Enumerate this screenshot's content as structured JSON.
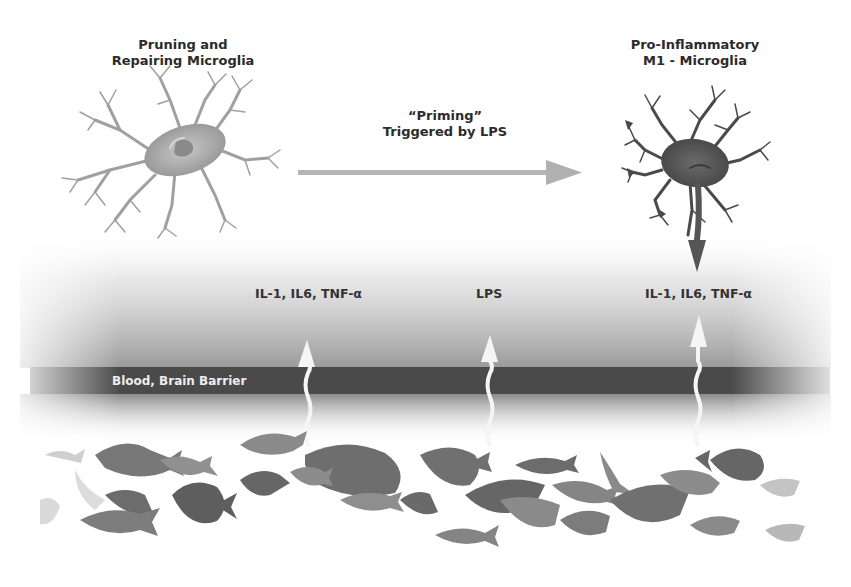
{
  "diagram": {
    "left_cell": {
      "title_line1": "Pruning and",
      "title_line2": "Repairing Microglia",
      "fill": "#a8a8a8"
    },
    "right_cell": {
      "title_line1": "Pro-Inflammatory",
      "title_line2": "M1 - Microglia",
      "fill": "#555555"
    },
    "priming_arrow": {
      "line1": "“Priming”",
      "line2": "Triggered by LPS"
    },
    "signals": [
      {
        "label": "IL-1, IL6, TNF-α",
        "position": "left"
      },
      {
        "label": "LPS",
        "position": "center"
      },
      {
        "label": "IL-1, IL6, TNF-α",
        "position": "right"
      }
    ],
    "barrier": {
      "label": "Blood, Brain Barrier",
      "color": "#4a4a4a"
    },
    "gut_region": {
      "description": "school of fish silhouettes",
      "fish_color": "#7a7a7a"
    }
  }
}
